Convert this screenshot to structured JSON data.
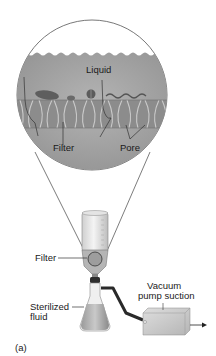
{
  "figure": {
    "panel_label": "(a)"
  },
  "magnified_view": {
    "labels": {
      "liquid": "Liquid",
      "filter": "Filter",
      "pore": "Pore"
    }
  },
  "apparatus": {
    "labels": {
      "filter": "Filter",
      "sterilized_fluid_line1": "Sterilized",
      "sterilized_fluid_line2": "fluid",
      "vacuum_line1": "Vacuum",
      "vacuum_line2": "pump suction"
    }
  },
  "colors": {
    "circle_liquid": "#a8a8a8",
    "filter_band": "#8f8f8f",
    "outline": "#555555",
    "box": "#c8c8c8",
    "tube": "#2a2a2a"
  }
}
